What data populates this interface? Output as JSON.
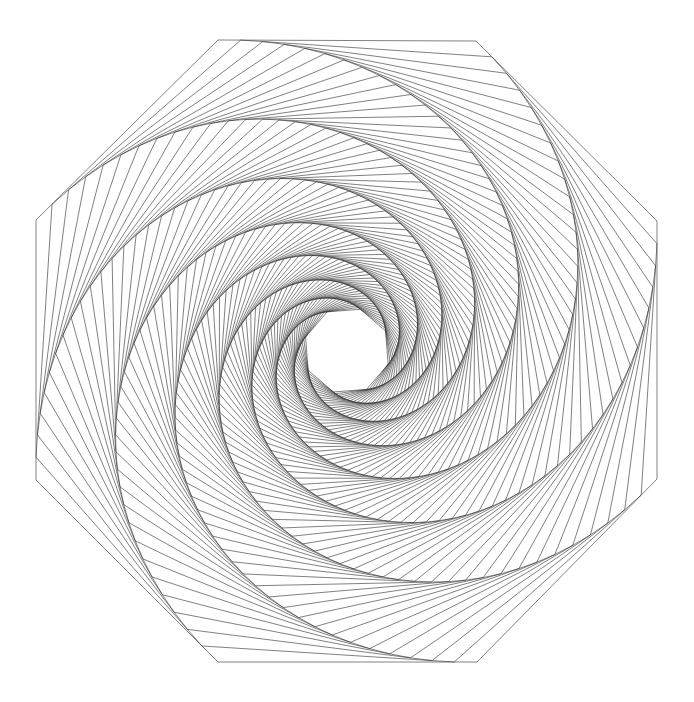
{
  "page": {
    "background_color": "#ffffff",
    "width": 694,
    "height": 702
  },
  "figure": {
    "name": "whirl-octagon-spiral",
    "stroke_color": "#2b2b2b",
    "stroke_width": 0.6,
    "fill": "none"
  },
  "chart_data": {
    "type": "line",
    "xlabel": "",
    "ylabel": "",
    "grid": false,
    "legend": null,
    "geometry": {
      "shape": "regular-polygon",
      "sides": 8,
      "center_x": 347,
      "center_y": 350,
      "outer_radius": 322,
      "start_angle_deg": 112.5,
      "steps": 86,
      "edge_fraction": 0.088,
      "inner_stop_radius": 7.0,
      "winding": "clockwise"
    },
    "outer_polygon_vertices": [
      [
        218,
        40
      ],
      [
        476,
        41
      ],
      [
        657,
        221
      ],
      [
        657,
        479
      ],
      [
        477,
        662
      ],
      [
        218,
        662
      ],
      [
        36,
        480
      ],
      [
        36,
        220
      ]
    ],
    "axis_ranges": {
      "xlim": [
        0,
        694
      ],
      "ylim": [
        0,
        702
      ]
    }
  }
}
